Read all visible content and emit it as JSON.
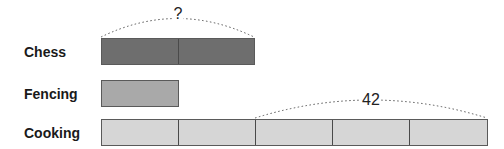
{
  "rows": [
    {
      "label": "Chess",
      "units": 2,
      "color": "#6e6e6e"
    },
    {
      "label": "Fencing",
      "units": 1,
      "color": "#a9a9a9"
    },
    {
      "label": "Cooking",
      "units": 5,
      "color": "#d6d6d6"
    }
  ],
  "brackets": [
    {
      "row": "Chess",
      "from_unit": 0,
      "to_unit": 2,
      "label": "?"
    },
    {
      "row": "Cooking",
      "from_unit": 2,
      "to_unit": 5,
      "label": "42"
    }
  ],
  "colors": {
    "chess": "#6e6e6e",
    "fencing": "#a9a9a9",
    "cooking": "#d6d6d6",
    "unit_border": "#4a4a4a",
    "bracket_dots": "#555555"
  }
}
